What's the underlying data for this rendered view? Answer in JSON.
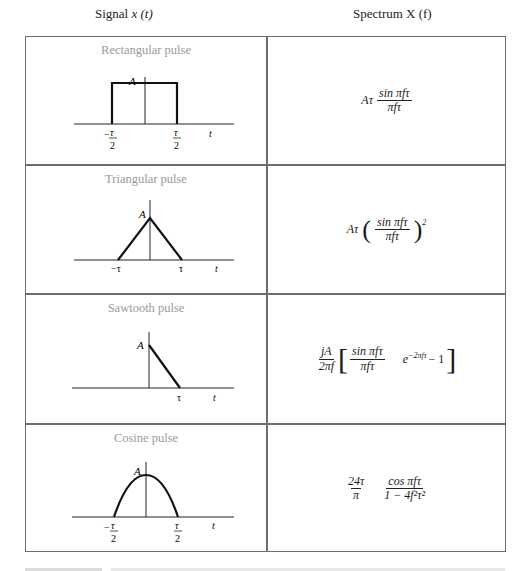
{
  "header": {
    "signal_label": "Signal",
    "signal_var": "x (t)",
    "spectrum_label": "Spectrum X (f)"
  },
  "rows": [
    {
      "title": "Rectangular pulse",
      "labels": {
        "amplitude": "A",
        "left": "−τ/2",
        "right": "τ/2",
        "axis": "t"
      },
      "spectrum": {
        "prefix": "Aτ",
        "num": "sin πfτ",
        "den": "πfτ"
      }
    },
    {
      "title": "Triangular pulse",
      "labels": {
        "amplitude": "A",
        "left": "−τ",
        "right": "τ",
        "axis": "t"
      },
      "spectrum": {
        "prefix": "Aτ",
        "num": "sin πfτ",
        "den": "πfτ",
        "power": "2"
      }
    },
    {
      "title": "Sawtooth pulse",
      "labels": {
        "amplitude": "A",
        "right": "τ",
        "axis": "t"
      },
      "spectrum": {
        "coef_num": "jA",
        "coef_den": "2πf",
        "num": "sin πfτ",
        "den": "πfτ",
        "exp_base": "e",
        "exp_power": "−2πfτ",
        "tail": "− 1"
      }
    },
    {
      "title": "Cosine pulse",
      "labels": {
        "amplitude": "A",
        "left": "−τ/2",
        "right": "τ/2",
        "axis": "t"
      },
      "spectrum": {
        "coef_num": "24τ",
        "coef_den": "π",
        "num": "cos πfτ",
        "den": "1 − 4f²τ²"
      }
    }
  ],
  "fraction_parts": {
    "tau": "τ",
    "two": "2",
    "minus": "−"
  }
}
